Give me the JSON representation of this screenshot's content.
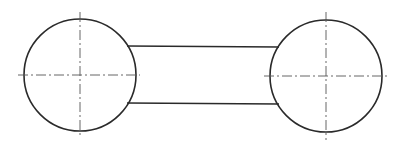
{
  "diagram": {
    "type": "technical-drawing",
    "colors": {
      "background": "#ffffff",
      "outline": "#2a2a2a",
      "centerline": "#555555"
    },
    "shapes": {
      "left_circle": {
        "cx": 80,
        "cy": 75,
        "r": 56
      },
      "right_circle": {
        "cx": 326,
        "cy": 76,
        "r": 56
      },
      "top_link_line": {
        "x1": 127,
        "y1": 46,
        "x2": 279,
        "y2": 47
      },
      "bottom_link_line": {
        "x1": 127,
        "y1": 103,
        "x2": 279,
        "y2": 104
      },
      "left_h_centerline": {
        "x1": 18,
        "y1": 75,
        "x2": 140,
        "y2": 75
      },
      "left_v_centerline": {
        "x1": 80,
        "y1": 12,
        "x2": 80,
        "y2": 138
      },
      "right_h_centerline": {
        "x1": 264,
        "y1": 76,
        "x2": 390,
        "y2": 76
      },
      "right_v_centerline": {
        "x1": 326,
        "y1": 12,
        "x2": 326,
        "y2": 140
      }
    }
  }
}
